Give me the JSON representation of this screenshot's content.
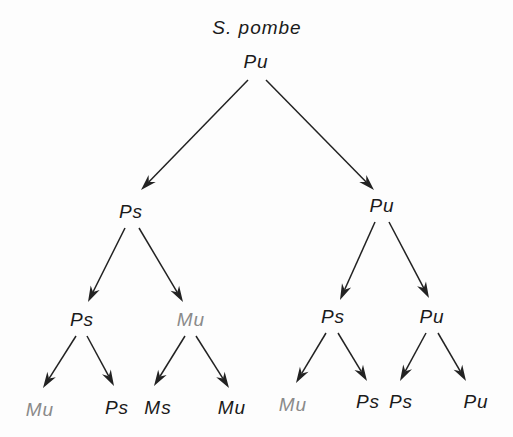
{
  "title": "S. pombe",
  "colors": {
    "dark": "#1a1a1a",
    "gray": "#8a8a8a",
    "line": "#222222"
  },
  "nodes": [
    {
      "id": "root",
      "label": "Pu",
      "x": 256,
      "y": 62,
      "color": "dark"
    },
    {
      "id": "l1a",
      "label": "Ps",
      "x": 131,
      "y": 212,
      "color": "dark"
    },
    {
      "id": "l1b",
      "label": "Pu",
      "x": 382,
      "y": 206,
      "color": "dark"
    },
    {
      "id": "l2a",
      "label": "Ps",
      "x": 82,
      "y": 320,
      "color": "dark"
    },
    {
      "id": "l2b",
      "label": "Mu",
      "x": 191,
      "y": 320,
      "color": "gray"
    },
    {
      "id": "l2c",
      "label": "Ps",
      "x": 333,
      "y": 317,
      "color": "dark"
    },
    {
      "id": "l2d",
      "label": "Pu",
      "x": 432,
      "y": 317,
      "color": "dark"
    },
    {
      "id": "l3a",
      "label": "Mu",
      "x": 40,
      "y": 410,
      "color": "gray"
    },
    {
      "id": "l3b",
      "label": "Ps",
      "x": 117,
      "y": 408,
      "color": "dark"
    },
    {
      "id": "l3c",
      "label": "Ms",
      "x": 158,
      "y": 408,
      "color": "dark"
    },
    {
      "id": "l3d",
      "label": "Mu",
      "x": 232,
      "y": 408,
      "color": "dark"
    },
    {
      "id": "l3e",
      "label": "Mu",
      "x": 293,
      "y": 405,
      "color": "gray"
    },
    {
      "id": "l3f",
      "label": "Ps",
      "x": 368,
      "y": 402,
      "color": "dark"
    },
    {
      "id": "l3g",
      "label": "Ps",
      "x": 401,
      "y": 402,
      "color": "dark"
    },
    {
      "id": "l3h",
      "label": "Pu",
      "x": 476,
      "y": 402,
      "color": "dark"
    }
  ],
  "edges": [
    {
      "from": [
        248,
        80
      ],
      "to": [
        141,
        190
      ]
    },
    {
      "from": [
        266,
        80
      ],
      "to": [
        374,
        190
      ]
    },
    {
      "from": [
        125,
        228
      ],
      "to": [
        88,
        302
      ]
    },
    {
      "from": [
        139,
        228
      ],
      "to": [
        183,
        302
      ]
    },
    {
      "from": [
        375,
        222
      ],
      "to": [
        340,
        300
      ]
    },
    {
      "from": [
        389,
        222
      ],
      "to": [
        429,
        298
      ]
    },
    {
      "from": [
        76,
        336
      ],
      "to": [
        43,
        388
      ]
    },
    {
      "from": [
        87,
        336
      ],
      "to": [
        114,
        386
      ]
    },
    {
      "from": [
        185,
        336
      ],
      "to": [
        154,
        386
      ]
    },
    {
      "from": [
        196,
        336
      ],
      "to": [
        229,
        388
      ]
    },
    {
      "from": [
        326,
        333
      ],
      "to": [
        296,
        383
      ]
    },
    {
      "from": [
        338,
        333
      ],
      "to": [
        367,
        381
      ]
    },
    {
      "from": [
        426,
        333
      ],
      "to": [
        400,
        381
      ]
    },
    {
      "from": [
        438,
        333
      ],
      "to": [
        466,
        381
      ]
    }
  ]
}
